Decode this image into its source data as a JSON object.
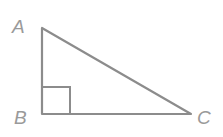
{
  "diagram": {
    "type": "right-triangle",
    "vertices": {
      "A": {
        "label": "A",
        "x": 42,
        "y": 28
      },
      "B": {
        "label": "B",
        "x": 42,
        "y": 114
      },
      "C": {
        "label": "C",
        "x": 191,
        "y": 114
      }
    },
    "right_angle_at": "B",
    "colors": {
      "stroke": "#8c8c8c",
      "label": "#9a9a9a",
      "background": "#ffffff"
    }
  }
}
